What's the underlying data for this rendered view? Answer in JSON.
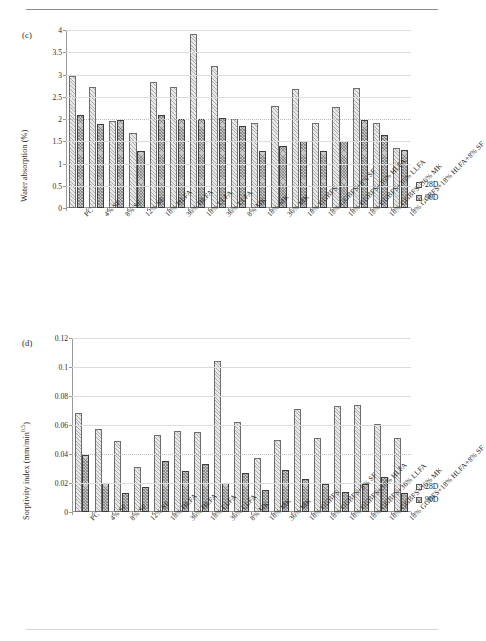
{
  "page": {
    "background": "#ffffff",
    "header_rule": true,
    "footer_rule": true
  },
  "legend_entries": [
    "28D",
    "90D"
  ],
  "categories": [
    "PC",
    "4% SF",
    "8% SF",
    "12% SF",
    "18% HLFA",
    "36% HLFA",
    "18% LLFA",
    "36% LLFA",
    "8% MK",
    "18% MK",
    "36% MK",
    "18% GGBFS",
    "18% GGBFS+8% SF",
    "18% GGBFS+36% HLFA",
    "18% GGBFS+36% LLFA",
    "18% GGBFS+36% MK",
    "18% GGBFS+18% HLFA+8% SF"
  ],
  "chart_data": [
    {
      "id": "c",
      "panel_label": "(c)",
      "type": "bar",
      "title": "",
      "xlabel": "",
      "ylabel": "Water absorption (%)",
      "ylabel_plain": "Water absorption (%)",
      "ylim": [
        0,
        4
      ],
      "ytick_values": [
        0,
        0.5,
        1,
        1.5,
        2,
        2.5,
        3,
        3.5,
        4
      ],
      "ytick_labels": [
        "0",
        "0.5",
        "1",
        "1.5",
        "2",
        "2.5",
        "3",
        "3.5",
        "4"
      ],
      "grid": true,
      "legend_position": "right",
      "categories": [
        "PC",
        "4% SF",
        "8% SF",
        "12% SF",
        "18% HLFA",
        "36% HLFA",
        "18% LLFA",
        "36% LLFA",
        "8% MK",
        "18% MK",
        "36% MK",
        "18% GGBFS",
        "18% GGBFS+8% SF",
        "18% GGBFS+36% HLFA",
        "18% GGBFS+36% LLFA",
        "18% GGBFS+36% MK",
        "18% GGBFS+18% HLFA+8% SF"
      ],
      "series": [
        {
          "name": "28D",
          "values": [
            2.97,
            2.73,
            1.96,
            1.68,
            2.83,
            2.73,
            3.9,
            3.2,
            2.0,
            1.91,
            2.3,
            2.67,
            1.9,
            2.28,
            2.69,
            1.91,
            1.35
          ]
        },
        {
          "name": "90D",
          "values": [
            2.09,
            1.89,
            1.97,
            1.28,
            2.09,
            2.0,
            2.0,
            2.02,
            1.85,
            1.28,
            1.4,
            1.51,
            1.28,
            1.5,
            1.97,
            1.63,
            1.3
          ]
        }
      ]
    },
    {
      "id": "d",
      "panel_label": "(d)",
      "type": "bar",
      "title": "",
      "xlabel": "",
      "ylabel": "Sorptivity index (mm/min",
      "ylabel_sup": "0.5",
      "ylabel_tail": ")",
      "ylim": [
        0,
        0.12
      ],
      "ytick_values": [
        0,
        0.02,
        0.04,
        0.06,
        0.08,
        0.1,
        0.12
      ],
      "ytick_labels": [
        "0",
        "0.02",
        "0.04",
        "0.06",
        "0.08",
        "0.1",
        "0.12"
      ],
      "grid": true,
      "legend_position": "right",
      "categories": [
        "PC",
        "4% SF",
        "8% SF",
        "12% SF",
        "18% HLFA",
        "36% HLFA",
        "18% LLFA",
        "36% LLFA",
        "8% MK",
        "18% MK",
        "36% MK",
        "18% GGBFS",
        "18% GGBFS+8% SF",
        "18% GGBFS+36% HLFA",
        "18% GGBFS+36% LLFA",
        "18% GGBFS+36% MK",
        "18% GGBFS+18% HLFA+8% SF"
      ],
      "series": [
        {
          "name": "28D",
          "values": [
            0.068,
            0.057,
            0.049,
            0.031,
            0.053,
            0.056,
            0.055,
            0.104,
            0.062,
            0.037,
            0.05,
            0.071,
            0.051,
            0.073,
            0.074,
            0.061,
            0.051
          ]
        },
        {
          "name": "90D",
          "values": [
            0.039,
            0.02,
            0.013,
            0.017,
            0.035,
            0.028,
            0.033,
            0.02,
            0.027,
            0.015,
            0.029,
            0.023,
            0.019,
            0.014,
            0.019,
            0.024,
            0.013
          ]
        }
      ]
    }
  ]
}
